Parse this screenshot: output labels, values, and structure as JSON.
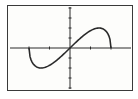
{
  "window": {
    "type": "graphing-calculator-screen"
  },
  "chart_data": {
    "type": "line",
    "title": "",
    "xlabel": "",
    "ylabel": "",
    "function_shape": "odd cubic-like curve, x*sqrt(4-x^2)",
    "xlim": [
      -3,
      3
    ],
    "ylim": [
      -4,
      4
    ],
    "x_ticks": [
      -2,
      -1,
      1,
      2
    ],
    "y_tick_spacing": 1,
    "grid": false,
    "series": [
      {
        "name": "y1",
        "x": [
          -2,
          -1.75,
          -1.5,
          -1.414,
          -1,
          -0.5,
          0,
          0.5,
          1,
          1.414,
          1.5,
          1.75,
          2
        ],
        "values": [
          0,
          -1.69,
          -1.98,
          -2,
          -1.73,
          -0.97,
          0,
          0.97,
          1.73,
          2,
          1.98,
          1.69,
          0
        ]
      }
    ],
    "colors": {
      "curve": "#2a2a2a",
      "axes": "#2a2a2a",
      "background": "#fdfdfb"
    }
  }
}
